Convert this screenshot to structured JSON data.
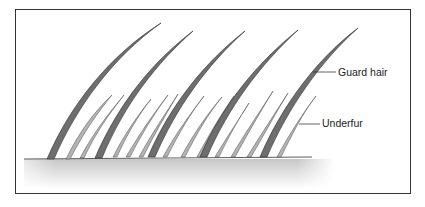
{
  "figure": {
    "labels": {
      "guard_hair": "Guard hair",
      "underfur": "Underfur"
    },
    "colors": {
      "frame": "#333333",
      "guard_hair": "#6e6e6e",
      "guard_hair_edge": "#2e2e2e",
      "underfur": "#b4b4b4",
      "underfur_edge": "#4a4a4a",
      "skin_top": "#c8c8c8",
      "skin_bottom": "#ffffff"
    }
  }
}
